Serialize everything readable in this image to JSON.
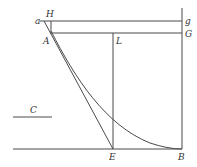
{
  "diagram": {
    "type": "geometric figure",
    "labels": {
      "a": "a",
      "H": "H",
      "g": "g",
      "A": "A",
      "G": "G",
      "L": "L",
      "C": "C",
      "E": "E",
      "B": "B"
    },
    "points": {
      "a": [
        44,
        21
      ],
      "H": [
        51,
        21
      ],
      "g": [
        182,
        21
      ],
      "A": [
        52,
        33
      ],
      "G": [
        182,
        33
      ],
      "L": [
        113,
        33
      ],
      "E": [
        113,
        149
      ],
      "B": [
        182,
        149
      ]
    },
    "segments": [
      [
        "a",
        "g"
      ],
      [
        "A",
        "G"
      ],
      [
        "H",
        "A"
      ],
      [
        "a",
        "E"
      ],
      [
        "L",
        "E"
      ],
      [
        "g",
        "B"
      ],
      [
        "E",
        "B"
      ]
    ],
    "curve": {
      "from": "A",
      "to": "B",
      "kind": "convex curve tangent to baseline at B"
    },
    "reference_line": {
      "label": "C",
      "from": [
        13,
        117
      ],
      "to": [
        52,
        117
      ]
    },
    "baseline": {
      "from": [
        13,
        149
      ],
      "to": [
        182,
        149
      ]
    },
    "stroke_color": "#4a4a4a"
  }
}
